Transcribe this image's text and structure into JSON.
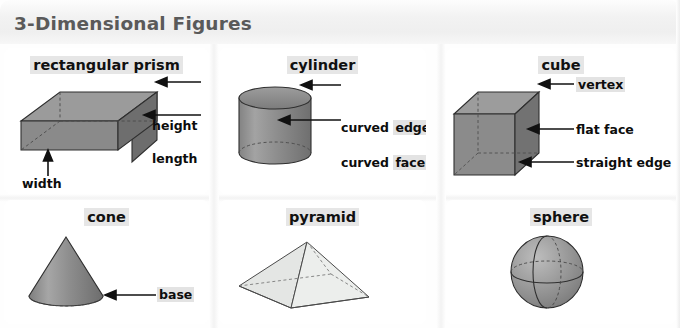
{
  "title": "3-Dimensional Figures",
  "colors": {
    "title_text": "#5a5a5a",
    "band_background": "#f1f1f1",
    "label_text": "#0d0d0d",
    "label_highlight": "#e3e3e3",
    "solid_mid_gray": "#8d8d8d",
    "solid_dark_gray": "#6e6e6e",
    "solid_light_gray": "#a8a8a8",
    "pyramid_fill": "#e8e9e8",
    "outline": "#3a3a3a"
  },
  "cells": [
    {
      "id": "rectangular-prism",
      "heading": "rectangular prism",
      "heading_highlighted": true,
      "figure": "rectangular-prism",
      "labels": [
        {
          "text": "height",
          "highlight": false,
          "arrow": "left"
        },
        {
          "text": "length",
          "highlight": false,
          "arrow": "left"
        },
        {
          "text": "width",
          "highlight": false,
          "arrow": "up"
        }
      ]
    },
    {
      "id": "cylinder",
      "heading": "cylinder",
      "heading_highlighted": true,
      "figure": "cylinder",
      "labels": [
        {
          "text": "curved",
          "text2": "edge",
          "highlight": true,
          "arrow": "left"
        },
        {
          "text": "curved",
          "text2": "face",
          "highlight": true,
          "arrow": "left"
        }
      ]
    },
    {
      "id": "cube",
      "heading": "cube",
      "heading_highlighted": true,
      "figure": "cube",
      "labels": [
        {
          "text": "vertex",
          "highlight": true,
          "arrow": "left"
        },
        {
          "text": "flat face",
          "highlight": false,
          "arrow": "left"
        },
        {
          "text": "straight edge",
          "highlight": false,
          "arrow": "left"
        }
      ]
    },
    {
      "id": "cone",
      "heading": "cone",
      "heading_highlighted": true,
      "figure": "cone",
      "labels": [
        {
          "text": "base",
          "highlight": true,
          "arrow": "left"
        }
      ]
    },
    {
      "id": "pyramid",
      "heading": "pyramid",
      "heading_highlighted": true,
      "figure": "pyramid",
      "labels": []
    },
    {
      "id": "sphere",
      "heading": "sphere",
      "heading_highlighted": true,
      "figure": "sphere",
      "labels": []
    }
  ],
  "label_text": {
    "height": "height",
    "length": "length",
    "width": "width",
    "curved": "curved",
    "edge": "edge",
    "face": "face",
    "vertex": "vertex",
    "flat_face": "flat face",
    "straight_edge": "straight edge",
    "base": "base"
  }
}
